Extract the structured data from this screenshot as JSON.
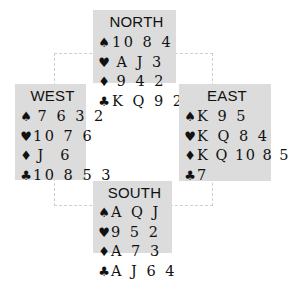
{
  "diagram": {
    "type": "bridge-deal",
    "hands": {
      "north": {
        "label": "NORTH",
        "spades": "10 8 4",
        "hearts": "A J 3",
        "diamonds": "9 4 2",
        "clubs": "K Q 9 2"
      },
      "west": {
        "label": "WEST",
        "spades": "7 6 3 2",
        "hearts": "10 7 6",
        "diamonds": "J  6",
        "clubs": "10 8 5 3"
      },
      "east": {
        "label": "EAST",
        "spades": "K 9 5",
        "hearts": "K Q 8 4",
        "diamonds": "K Q 10 8 5",
        "clubs": "7"
      },
      "south": {
        "label": "SOUTH",
        "spades": "A Q J",
        "hearts": "9 5 2",
        "diamonds": "A 7 3",
        "clubs": "A J 6 4"
      }
    },
    "suit_symbols": {
      "spades": "♠",
      "hearts": "♥",
      "diamonds": "♦",
      "clubs": "♣"
    },
    "colors": {
      "box_background": "#dcdcdc",
      "dashed_line": "#cfcfcf",
      "text": "#111111"
    }
  }
}
